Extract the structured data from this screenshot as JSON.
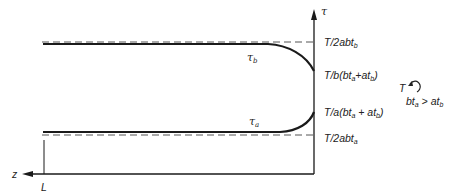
{
  "diagram": {
    "axes": {
      "vertical_label": "τ",
      "horizontal_label": "z",
      "length_mark": "L"
    },
    "curves": [
      {
        "name": "tau_b",
        "label_base": "τ",
        "label_sub": "b"
      },
      {
        "name": "tau_a",
        "label_base": "τ",
        "label_sub": "a"
      }
    ],
    "levels": {
      "upper_asymptote": {
        "pre": "T/2abt",
        "sub": "b"
      },
      "tau_b_end": {
        "pre": "T/b(bt",
        "sub1": "a",
        "mid": "+at",
        "sub2": "b",
        "post": ")"
      },
      "tau_a_end": {
        "pre": "T/a(bt",
        "sub1": "a",
        "mid": " + at",
        "sub2": "b",
        "post": ")"
      },
      "lower_asymptote": {
        "pre": "T/2abt",
        "sub": "a"
      }
    },
    "condition": {
      "torque_label": "T",
      "inequality_pre": "bt",
      "inequality_sub1": "a",
      "inequality_mid": " > at",
      "inequality_sub2": "b"
    },
    "colors": {
      "line": "#1a1a1a",
      "dashed": "#555555"
    }
  }
}
